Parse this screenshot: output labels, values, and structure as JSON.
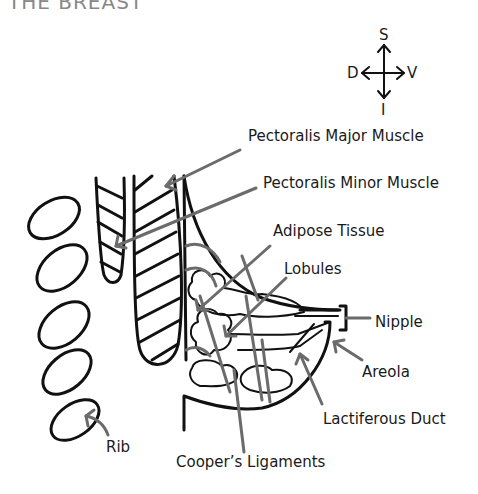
{
  "title": "THE BREAST",
  "compass": {
    "up": "S",
    "down": "I",
    "left": "D",
    "right": "V"
  },
  "labels": {
    "pectoralis_major": "Pectoralis Major Muscle",
    "pectoralis_minor": "Pectoralis Minor Muscle",
    "adipose": "Adipose Tissue",
    "lobules": "Lobules",
    "nipple": "Nipple",
    "areola": "Areola",
    "lactiferous_duct": "Lactiferous Duct",
    "rib": "Rib",
    "coopers_ligaments": "Cooper’s Ligaments"
  },
  "colors": {
    "ink": "#111111",
    "leader": "#6b6b6b",
    "background": "#ffffff"
  }
}
